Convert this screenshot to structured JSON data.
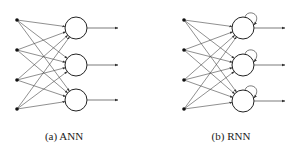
{
  "panels": [
    {
      "id": "ann",
      "caption": "(a) ANN",
      "recurrent": false,
      "inputs_x": 17,
      "input_ys": [
        20,
        50,
        80,
        109
      ],
      "neuron_x": 76,
      "neuron_ys": [
        28,
        65,
        100
      ],
      "radius": 11,
      "output_end_x": 118,
      "caption_x": 64,
      "caption_y": 130
    },
    {
      "id": "rnn",
      "caption": "(b) RNN",
      "recurrent": true,
      "inputs_x": 184,
      "input_ys": [
        20,
        50,
        80,
        109
      ],
      "neuron_x": 243,
      "neuron_ys": [
        28,
        65,
        101
      ],
      "radius": 11,
      "output_end_x": 285,
      "caption_x": 231,
      "caption_y": 130
    }
  ],
  "colors": {
    "line": "#444444",
    "node": "#111111"
  }
}
